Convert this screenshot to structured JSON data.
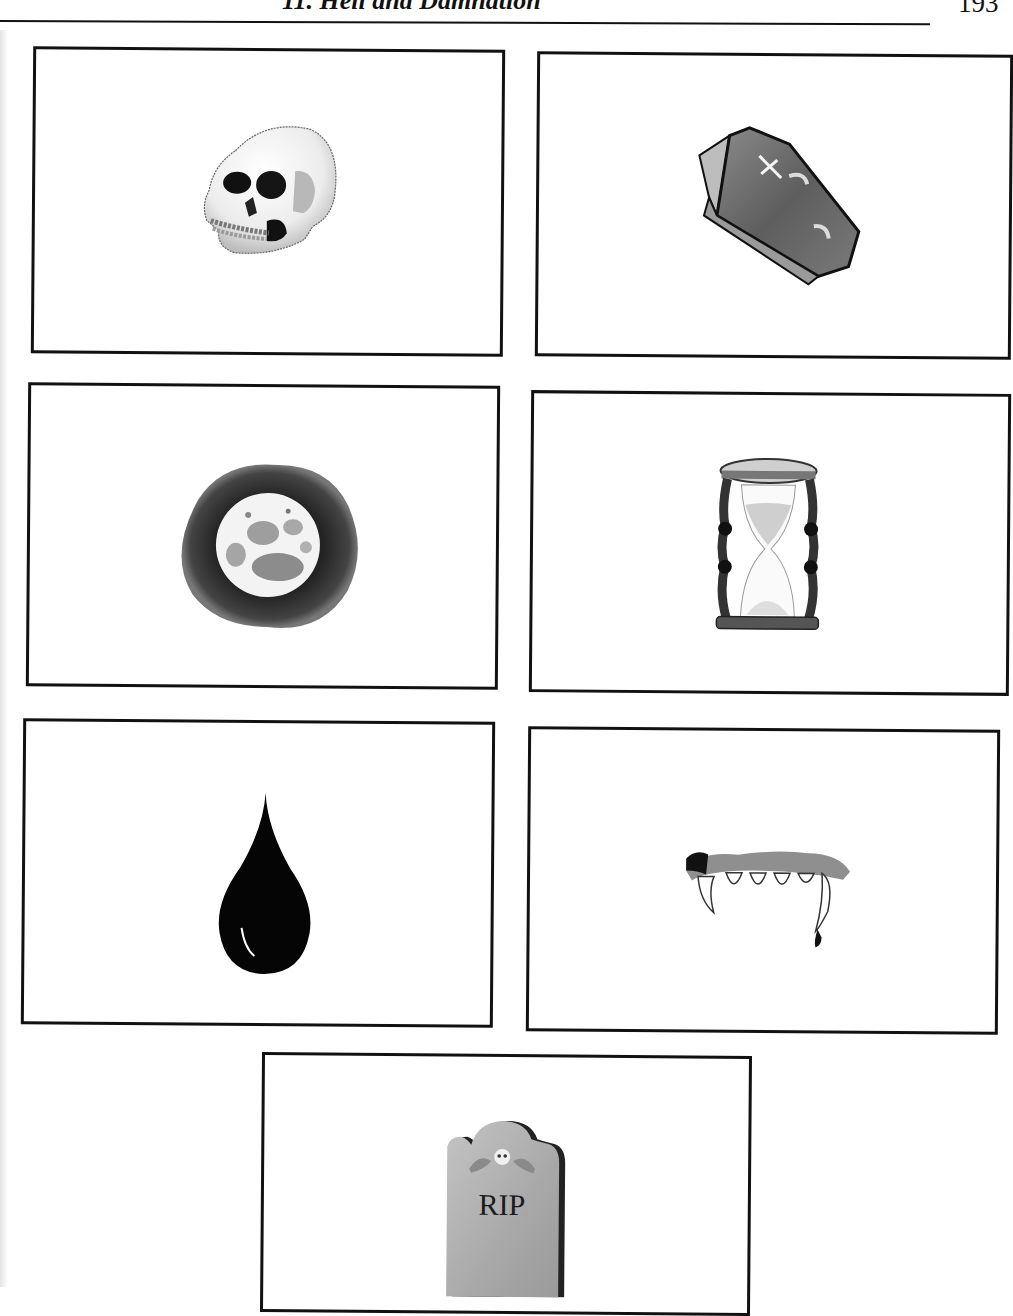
{
  "page": {
    "running_title": "11. Hell and Damnation",
    "page_number": "193"
  },
  "frames": [
    {
      "id": "skull",
      "label": "Skull"
    },
    {
      "id": "coffin",
      "label": "Coffin"
    },
    {
      "id": "full-moon",
      "label": "Full moon"
    },
    {
      "id": "hourglass",
      "label": "Hourglass"
    },
    {
      "id": "blood-drop",
      "label": "Blood drop"
    },
    {
      "id": "vampire-fangs",
      "label": "Vampire fangs"
    },
    {
      "id": "tombstone",
      "label": "Tombstone",
      "inscription": "RIP"
    }
  ],
  "colors": {
    "ink": "#111111",
    "paper": "#ffffff",
    "stone": "#a9a9a9"
  }
}
